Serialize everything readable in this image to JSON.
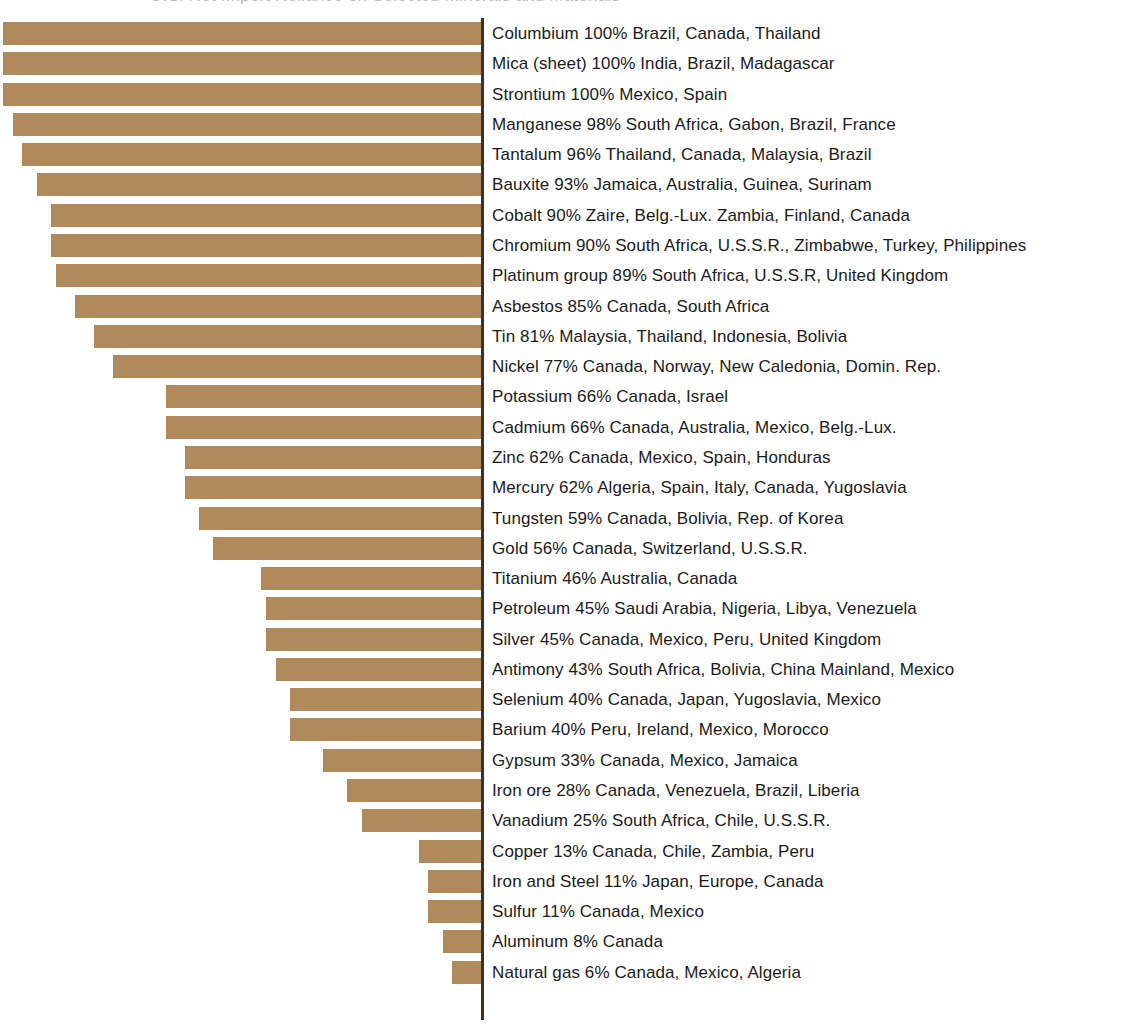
{
  "page": {
    "clipped_header_text": "U.S. Net Import Reliance on Selected Minerals and Materials",
    "axis_label": ""
  },
  "style": {
    "bar_color": "#b08a5a",
    "axis_color": "#3c3227",
    "text_color": "#1b1b1b",
    "background": "#ffffff"
  },
  "chart_data": {
    "type": "bar",
    "orientation": "horizontal",
    "title": "",
    "xlabel": "",
    "ylabel": "",
    "xlim": [
      0,
      100
    ],
    "grid": false,
    "legend": false,
    "value_unit": "%",
    "note": "Bars are right-aligned against a vertical axis; bar length is proportional to percent imported. Each label reads: mineral, percent, then principal sources.",
    "categories": [
      "Columbium",
      "Mica (sheet)",
      "Strontium",
      "Manganese",
      "Tantalum",
      "Bauxite",
      "Cobalt",
      "Chromium",
      "Platinum group",
      "Asbestos",
      "Tin",
      "Nickel",
      "Potassium",
      "Cadmium",
      "Zinc",
      "Mercury",
      "Tungsten",
      "Gold",
      "Titanium",
      "Petroleum",
      "Silver",
      "Antimony",
      "Selenium",
      "Barium",
      "Gypsum",
      "Iron ore",
      "Vanadium",
      "Copper",
      "Iron and Steel",
      "Sulfur",
      "Aluminum",
      "Natural gas"
    ],
    "values": [
      100,
      100,
      100,
      98,
      96,
      93,
      90,
      90,
      89,
      85,
      81,
      77,
      66,
      66,
      62,
      62,
      59,
      56,
      46,
      45,
      45,
      43,
      40,
      40,
      33,
      28,
      25,
      13,
      11,
      11,
      8,
      6
    ],
    "rows": [
      {
        "mineral": "Columbium",
        "percent": 100,
        "percent_text": "100%",
        "sources": "Brazil, Canada, Thailand"
      },
      {
        "mineral": "Mica (sheet)",
        "percent": 100,
        "percent_text": "100%",
        "sources": "India, Brazil, Madagascar"
      },
      {
        "mineral": "Strontium",
        "percent": 100,
        "percent_text": "100%",
        "sources": "Mexico, Spain"
      },
      {
        "mineral": "Manganese",
        "percent": 98,
        "percent_text": "98%",
        "sources": "South Africa, Gabon, Brazil, France"
      },
      {
        "mineral": "Tantalum",
        "percent": 96,
        "percent_text": "96%",
        "sources": "Thailand, Canada, Malaysia, Brazil"
      },
      {
        "mineral": "Bauxite",
        "percent": 93,
        "percent_text": "93%",
        "sources": "Jamaica, Australia, Guinea, Surinam"
      },
      {
        "mineral": "Cobalt",
        "percent": 90,
        "percent_text": "90%",
        "sources": "Zaire, Belg.-Lux. Zambia, Finland, Canada"
      },
      {
        "mineral": "Chromium",
        "percent": 90,
        "percent_text": "90%",
        "sources": "South Africa, U.S.S.R., Zimbabwe, Turkey, Philippines"
      },
      {
        "mineral": "Platinum group",
        "percent": 89,
        "percent_text": "89%",
        "sources": "South Africa, U.S.S.R, United Kingdom"
      },
      {
        "mineral": "Asbestos",
        "percent": 85,
        "percent_text": "85%",
        "sources": "Canada, South Africa"
      },
      {
        "mineral": "Tin",
        "percent": 81,
        "percent_text": "81%",
        "sources": "Malaysia, Thailand, Indonesia, Bolivia"
      },
      {
        "mineral": "Nickel",
        "percent": 77,
        "percent_text": "77%",
        "sources": "Canada, Norway, New Caledonia, Domin. Rep."
      },
      {
        "mineral": "Potassium",
        "percent": 66,
        "percent_text": "66%",
        "sources": "Canada, Israel"
      },
      {
        "mineral": "Cadmium",
        "percent": 66,
        "percent_text": "66%",
        "sources": "Canada, Australia, Mexico, Belg.-Lux."
      },
      {
        "mineral": "Zinc",
        "percent": 62,
        "percent_text": "62%",
        "sources": "Canada, Mexico, Spain, Honduras"
      },
      {
        "mineral": "Mercury",
        "percent": 62,
        "percent_text": "62%",
        "sources": "Algeria, Spain, Italy, Canada, Yugoslavia"
      },
      {
        "mineral": "Tungsten",
        "percent": 59,
        "percent_text": "59%",
        "sources": "Canada, Bolivia, Rep. of Korea"
      },
      {
        "mineral": "Gold",
        "percent": 56,
        "percent_text": "56%",
        "sources": "Canada, Switzerland, U.S.S.R."
      },
      {
        "mineral": "Titanium",
        "percent": 46,
        "percent_text": "46%",
        "sources": "Australia, Canada"
      },
      {
        "mineral": "Petroleum",
        "percent": 45,
        "percent_text": "45%",
        "sources": "Saudi Arabia, Nigeria, Libya, Venezuela"
      },
      {
        "mineral": "Silver",
        "percent": 45,
        "percent_text": "45%",
        "sources": "Canada, Mexico, Peru, United Kingdom"
      },
      {
        "mineral": "Antimony",
        "percent": 43,
        "percent_text": "43%",
        "sources": "South Africa, Bolivia, China Mainland, Mexico"
      },
      {
        "mineral": "Selenium",
        "percent": 40,
        "percent_text": "40%",
        "sources": "Canada, Japan, Yugoslavia, Mexico"
      },
      {
        "mineral": "Barium",
        "percent": 40,
        "percent_text": "40%",
        "sources": "Peru, Ireland, Mexico, Morocco"
      },
      {
        "mineral": "Gypsum",
        "percent": 33,
        "percent_text": "33%",
        "sources": "Canada, Mexico, Jamaica"
      },
      {
        "mineral": "Iron ore",
        "percent": 28,
        "percent_text": "28%",
        "sources": "Canada, Venezuela, Brazil, Liberia"
      },
      {
        "mineral": "Vanadium",
        "percent": 25,
        "percent_text": "25%",
        "sources": "South Africa, Chile, U.S.S.R."
      },
      {
        "mineral": "Copper",
        "percent": 13,
        "percent_text": "13%",
        "sources": "Canada, Chile, Zambia, Peru"
      },
      {
        "mineral": "Iron and Steel",
        "percent": 11,
        "percent_text": "11%",
        "sources": "Japan, Europe, Canada"
      },
      {
        "mineral": "Sulfur",
        "percent": 11,
        "percent_text": "11%",
        "sources": "Canada, Mexico"
      },
      {
        "mineral": "Aluminum",
        "percent": 8,
        "percent_text": "8%",
        "sources": "Canada"
      },
      {
        "mineral": "Natural gas",
        "percent": 6,
        "percent_text": "6%",
        "sources": "Canada, Mexico, Algeria"
      }
    ]
  }
}
